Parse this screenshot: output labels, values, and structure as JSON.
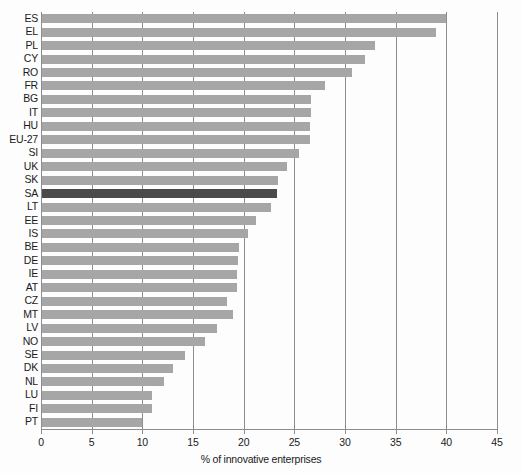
{
  "chart_data": {
    "type": "bar",
    "orientation": "horizontal",
    "title": "",
    "xlabel": "% of innovative enterprises",
    "ylabel": "",
    "xlim": [
      0,
      45
    ],
    "xticks": [
      0,
      5,
      10,
      15,
      20,
      25,
      30,
      35,
      40,
      45
    ],
    "grid": true,
    "legend": "none",
    "highlight_category": "SA",
    "colors": {
      "bar": "#a6a6a6",
      "highlight_bar": "#4a4a4a",
      "axis": "#8d8d8d",
      "text": "#1a1a1a",
      "background": "#fdfdfd"
    },
    "categories": [
      "ES",
      "EL",
      "PL",
      "CY",
      "RO",
      "FR",
      "BG",
      "IT",
      "HU",
      "EU-27",
      "SI",
      "UK",
      "SK",
      "SA",
      "LT",
      "EE",
      "IS",
      "BE",
      "DE",
      "IE",
      "AT",
      "CZ",
      "MT",
      "LV",
      "NO",
      "SE",
      "DK",
      "NL",
      "LU",
      "FI",
      "PT"
    ],
    "values": [
      40.0,
      39.0,
      33.0,
      32.0,
      30.7,
      28.0,
      26.6,
      26.6,
      26.5,
      26.5,
      25.5,
      24.3,
      23.4,
      23.3,
      22.7,
      21.2,
      20.4,
      19.5,
      19.4,
      19.3,
      19.3,
      18.4,
      18.9,
      17.4,
      16.2,
      14.2,
      13.0,
      12.1,
      11.0,
      11.0,
      10.0
    ]
  }
}
